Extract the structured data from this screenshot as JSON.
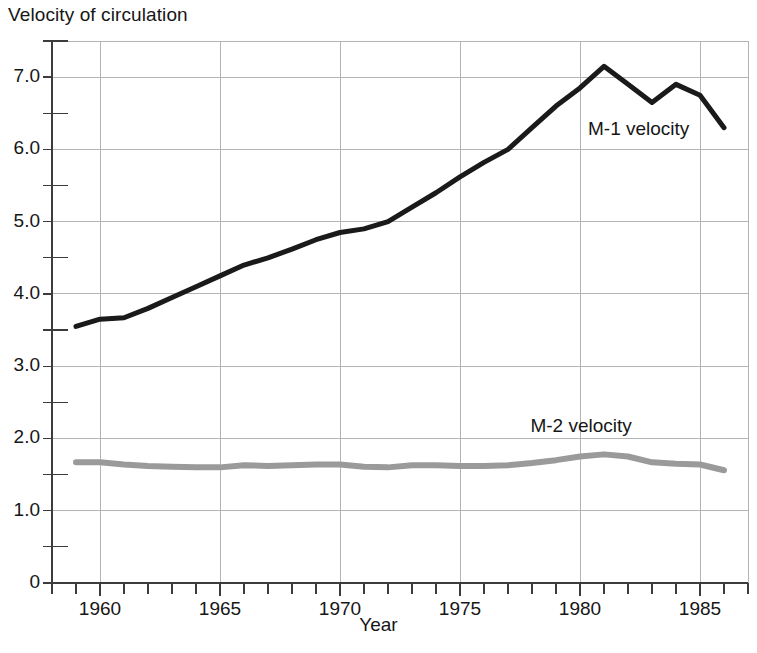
{
  "chart_data": {
    "type": "line",
    "title": "Velocity of circulation",
    "xlabel": "Year",
    "ylabel": "",
    "xlim": [
      1958,
      1987
    ],
    "ylim": [
      0,
      7.5
    ],
    "grid": true,
    "legend_position": "inline-annotation",
    "y_tick_labels": [
      "0",
      "1.0",
      "2.0",
      "3.0",
      "4.0",
      "5.0",
      "6.0",
      "7.0"
    ],
    "y_tick_values": [
      0,
      1.0,
      2.0,
      3.0,
      4.0,
      5.0,
      6.0,
      7.0
    ],
    "y_minor_tick_values": [
      0.5,
      1.5,
      2.5,
      3.5,
      4.5,
      5.5,
      6.5,
      7.5
    ],
    "x_tick_labels": [
      "1960",
      "1965",
      "1970",
      "1975",
      "1980",
      "1985"
    ],
    "x_tick_values": [
      1960,
      1965,
      1970,
      1975,
      1980,
      1985
    ],
    "x_minor_tick_step": 1,
    "x": [
      1959,
      1960,
      1961,
      1962,
      1963,
      1964,
      1965,
      1966,
      1967,
      1968,
      1969,
      1970,
      1971,
      1972,
      1973,
      1974,
      1975,
      1976,
      1977,
      1978,
      1979,
      1980,
      1981,
      1982,
      1983,
      1984,
      1985,
      1986
    ],
    "series": [
      {
        "name": "M-1 velocity",
        "color": "#1a1a1a",
        "line_width": 5,
        "annotation": "M-1 velocity",
        "values": [
          3.55,
          3.65,
          3.67,
          3.8,
          3.95,
          4.1,
          4.25,
          4.4,
          4.5,
          4.62,
          4.75,
          4.85,
          4.9,
          5.0,
          5.2,
          5.4,
          5.62,
          5.82,
          6.0,
          6.3,
          6.6,
          6.85,
          7.15,
          6.9,
          6.65,
          6.9,
          6.75,
          6.3
        ]
      },
      {
        "name": "M-2 velocity",
        "color": "#9a9a9a",
        "line_width": 6,
        "annotation": "M-2 velocity",
        "values": [
          1.67,
          1.67,
          1.64,
          1.62,
          1.61,
          1.6,
          1.6,
          1.63,
          1.62,
          1.63,
          1.64,
          1.64,
          1.61,
          1.6,
          1.63,
          1.63,
          1.62,
          1.62,
          1.63,
          1.66,
          1.7,
          1.75,
          1.78,
          1.75,
          1.67,
          1.65,
          1.64,
          1.56
        ]
      }
    ],
    "annotations": [
      {
        "text": "M-1 velocity",
        "x": 1983.0,
        "y": 6.25
      },
      {
        "text": "M-2 velocity",
        "x": 1980.6,
        "y": 2.15
      }
    ],
    "colors": {
      "m1_line": "#1a1a1a",
      "m2_line": "#9a9a9a",
      "grid": "#b4b4b4",
      "axis": "#3c3c3c",
      "text": "#161616",
      "background": "#ffffff"
    }
  }
}
